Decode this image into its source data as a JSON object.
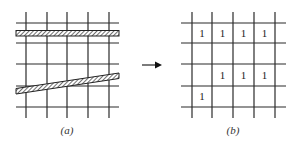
{
  "figure": {
    "left_panel": {
      "caption": "(a)",
      "description": "4x4 grid with two hatched line features: one horizontal band and one slanted band"
    },
    "arrow": {
      "direction": "right"
    },
    "right_panel": {
      "caption": "(b)",
      "description": "4x4 raster grid with cells marked 1 where the line features pass",
      "cells": [
        [
          "1",
          "1",
          "1",
          "1"
        ],
        [
          "",
          "",
          "",
          ""
        ],
        [
          "",
          "1",
          "1",
          "1"
        ],
        [
          "1",
          "",
          "",
          ""
        ]
      ]
    }
  }
}
